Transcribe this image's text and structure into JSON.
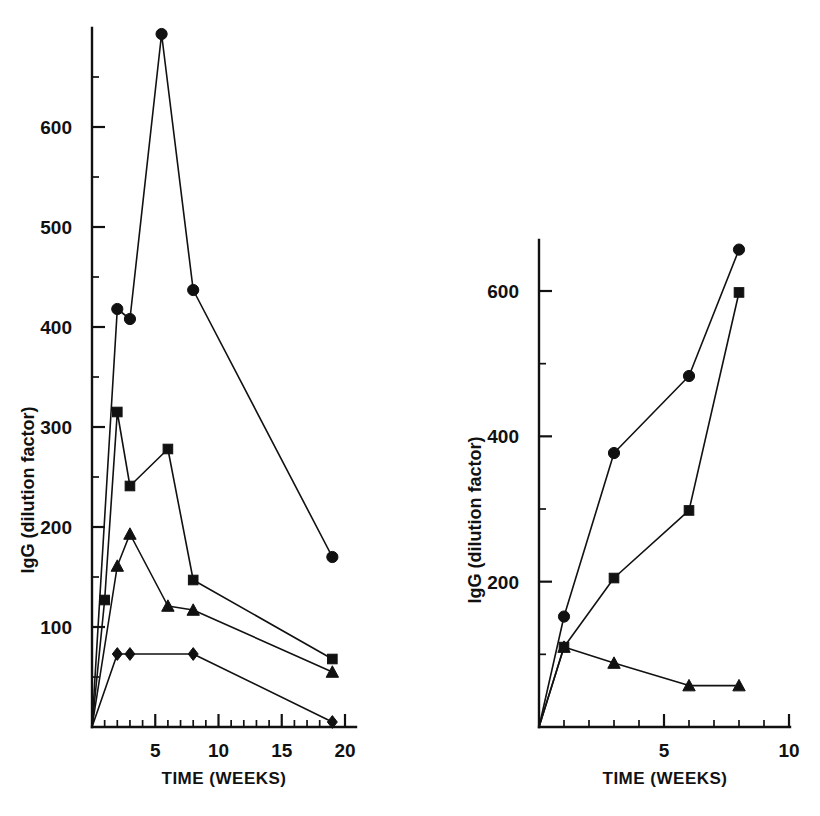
{
  "figure": {
    "background": "#ffffff",
    "ink_color": "#111111",
    "panel_count": 2
  },
  "chart_data": [
    {
      "type": "line",
      "panel": "left",
      "title": "",
      "xlabel": "TIME   (WEEKS)",
      "ylabel": "IgG  (dilution factor)",
      "xlim": [
        0,
        20
      ],
      "ylim": [
        0,
        720
      ],
      "grid": false,
      "legend": "none",
      "xticks": [
        5,
        10,
        15,
        20
      ],
      "xtick_labels": [
        "5",
        "10",
        "15",
        "20"
      ],
      "xminor_step": 1,
      "yticks": [
        100,
        200,
        300,
        400,
        500,
        600
      ],
      "ytick_labels": [
        "100",
        "200",
        "300",
        "400",
        "500",
        "600"
      ],
      "yminor_step": 50,
      "series": [
        {
          "name": "circle-series",
          "marker": "circle",
          "x": [
            0,
            2,
            3,
            5.5,
            8,
            19
          ],
          "values": [
            0,
            418,
            408,
            693,
            437,
            170
          ]
        },
        {
          "name": "square-series",
          "marker": "square",
          "x": [
            0,
            1,
            2,
            3,
            6,
            8,
            19
          ],
          "values": [
            0,
            127,
            315,
            241,
            278,
            147,
            68
          ]
        },
        {
          "name": "triangle-series",
          "marker": "triangle",
          "x": [
            0,
            2,
            3,
            6,
            8,
            19
          ],
          "values": [
            0,
            161,
            193,
            121,
            117,
            55
          ]
        },
        {
          "name": "diamond-series",
          "marker": "diamond",
          "x": [
            0,
            2,
            3,
            8,
            19
          ],
          "values": [
            0,
            73,
            73,
            73,
            5
          ]
        }
      ]
    },
    {
      "type": "line",
      "panel": "right",
      "title": "",
      "xlabel": "TIME   (WEEKS)",
      "ylabel": "IgG  (dilution factor)",
      "xlim": [
        0,
        10
      ],
      "ylim": [
        0,
        720
      ],
      "grid": false,
      "legend": "none",
      "xticks": [
        5,
        10
      ],
      "xtick_labels": [
        "5",
        "10"
      ],
      "xminor_step": 1,
      "yticks": [
        200,
        400,
        600
      ],
      "ytick_labels": [
        "200",
        "400",
        "600"
      ],
      "yminor_step": 100,
      "series": [
        {
          "name": "circle-series",
          "marker": "circle",
          "x": [
            0,
            1,
            3,
            6,
            8
          ],
          "values": [
            0,
            152,
            377,
            483,
            657
          ]
        },
        {
          "name": "square-series",
          "marker": "square",
          "x": [
            0,
            1,
            3,
            6,
            8
          ],
          "values": [
            0,
            110,
            205,
            298,
            598
          ]
        },
        {
          "name": "triangle-series",
          "marker": "triangle",
          "x": [
            0,
            1,
            3,
            6,
            8
          ],
          "values": [
            0,
            110,
            88,
            57,
            57
          ]
        }
      ]
    }
  ]
}
